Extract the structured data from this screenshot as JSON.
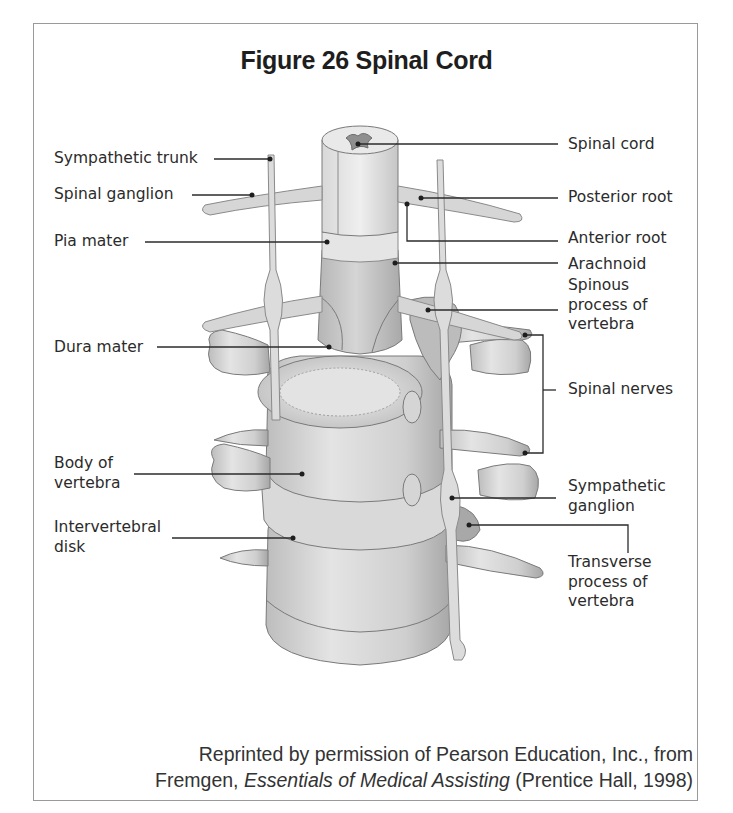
{
  "figure": {
    "title": "Figure 26  Spinal Cord"
  },
  "labels_left": [
    {
      "id": "sympathetic-trunk",
      "text": "Sympathetic trunk"
    },
    {
      "id": "spinal-ganglion",
      "text": "Spinal ganglion"
    },
    {
      "id": "pia-mater",
      "text": "Pia mater"
    },
    {
      "id": "dura-mater",
      "text": "Dura mater"
    },
    {
      "id": "body-of-vertebra",
      "text": "Body of\nvertebra"
    },
    {
      "id": "intervertebral-disk",
      "text": "Intervertebral\ndisk"
    }
  ],
  "labels_right": [
    {
      "id": "spinal-cord",
      "text": "Spinal cord"
    },
    {
      "id": "posterior-root",
      "text": "Posterior root"
    },
    {
      "id": "anterior-root",
      "text": "Anterior root"
    },
    {
      "id": "arachnoid",
      "text": "Arachnoid"
    },
    {
      "id": "spinous-process",
      "text": "Spinous\nprocess of\nvertebra"
    },
    {
      "id": "spinal-nerves",
      "text": "Spinal nerves"
    },
    {
      "id": "sympathetic-ganglion",
      "text": "Sympathetic\nganglion"
    },
    {
      "id": "transverse-process",
      "text": "Transverse\nprocess of\nvertebra"
    }
  ],
  "credit": {
    "line1": "Reprinted by permission of Pearson Education, Inc., from",
    "line2_prefix": "Fremgen, ",
    "line2_italic": "Essentials of Medical Assisting",
    "line2_suffix": " (Prentice Hall, 1998)"
  },
  "colors": {
    "frame": "#9a9a9a",
    "leader": "#2b2b2b",
    "bone_light": "#e6e6e6",
    "bone_mid": "#c4c4c4",
    "bone_dark": "#8c8c8c"
  }
}
